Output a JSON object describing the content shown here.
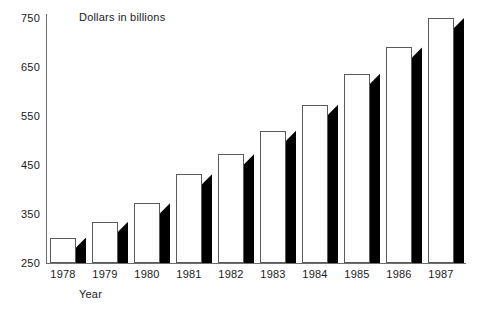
{
  "chart_data": {
    "type": "bar",
    "title": "",
    "xlabel": "Year",
    "ylabel": "Dollars in billions",
    "categories": [
      "1978",
      "1979",
      "1980",
      "1981",
      "1982",
      "1983",
      "1984",
      "1985",
      "1986",
      "1987"
    ],
    "values": [
      302,
      334,
      372,
      431,
      472,
      520,
      573,
      636,
      690,
      750
    ],
    "ylim": [
      250,
      750
    ],
    "yticks": [
      250,
      350,
      450,
      550,
      650,
      750
    ],
    "ytick_labels": [
      "250",
      "350",
      "450",
      "550",
      "650",
      "750"
    ],
    "grid": false,
    "legend": null,
    "style": {
      "bar_face_color": "#ffffff",
      "bar_edge_color": "#5a5a5a",
      "bar_shadow_color": "#000000",
      "axis_color": "#6e6e6e",
      "text_color": "#1a1a1a",
      "background": "#ffffff"
    }
  }
}
